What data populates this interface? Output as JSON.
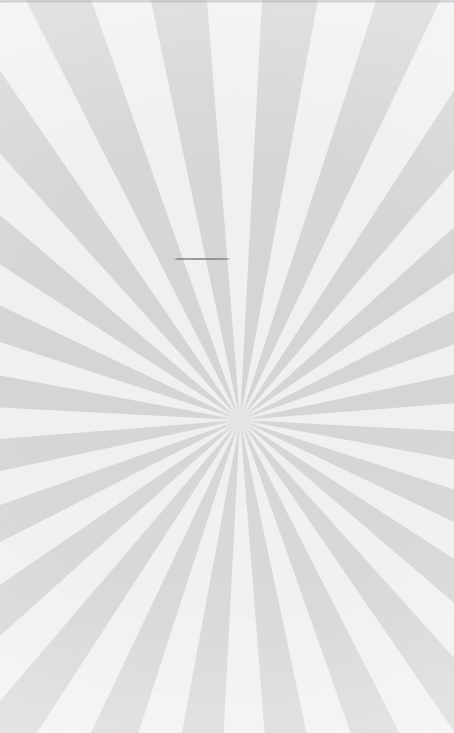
{
  "scene": {
    "title": "Sunburst Pattern Surface",
    "description": "Close-up photograph of a flat surface printed with a radial sunburst pattern in pale grey tones",
    "width": 454,
    "height": 733
  },
  "sunburst": {
    "name": "radial-sunburst",
    "center_x": 240,
    "center_y": 420,
    "segment_count": 48,
    "ray_count": 24,
    "segment_angle_deg": 7.5,
    "start_angle_deg": 3.0,
    "radius": 900,
    "ray_color": "#d4d5d5",
    "gap_color": "#eff0f0",
    "background_color": "#eff0f0"
  },
  "seams": [
    {
      "name": "seam-upper",
      "y": 260,
      "color": "#96989a",
      "opacity": 0.26
    },
    {
      "name": "seam-lower",
      "y": 611,
      "color": "#8e9193",
      "opacity": 0.34
    }
  ],
  "marks": [
    {
      "name": "hairline-mark",
      "x": 174,
      "y": 258,
      "width": 57,
      "color": "#5f6265"
    }
  ],
  "palette": {
    "ray_grey": "#d4d5d5",
    "gap_white": "#eff0f0",
    "light_band": "#ededed",
    "seam_grey": "#96989a",
    "mark_dark": "#5f6265"
  }
}
